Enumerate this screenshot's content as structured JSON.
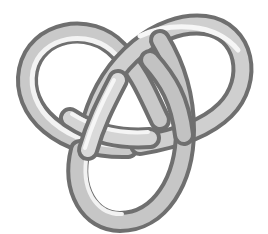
{
  "image": {
    "subject": "trefoil knot",
    "description": "3D-rendered grey tubular trefoil knot on white background",
    "colors": {
      "background": "#ffffff",
      "tube_light": "#f2f2f2",
      "tube_mid": "#bdbdbd",
      "tube_dark": "#6e6e6e"
    }
  }
}
